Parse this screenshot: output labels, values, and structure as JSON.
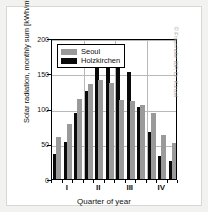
{
  "chart_data": {
    "type": "bar",
    "title": "",
    "xlabel": "Quarter of year",
    "ylabel": "Solar radiation, monthly sum [kWh/m²]",
    "ylim": [
      0,
      200
    ],
    "yticks": [
      0,
      50,
      100,
      150,
      200
    ],
    "xtick_labels": [
      "I",
      "II",
      "III",
      "IV"
    ],
    "grid": true,
    "legend_position": "top-left",
    "categories": [
      "1",
      "2",
      "3",
      "4",
      "5",
      "6",
      "7",
      "8",
      "9",
      "10",
      "11",
      "12"
    ],
    "series": [
      {
        "name": "Seoul",
        "color": "#9a9a9a",
        "values": [
          60,
          78,
          113,
          135,
          141,
          136,
          112,
          110,
          105,
          93,
          62,
          51
        ]
      },
      {
        "name": "Holzkirchen",
        "color": "#0a0a0a",
        "values": [
          36,
          53,
          94,
          125,
          165,
          167,
          173,
          152,
          102,
          66,
          33,
          25
        ]
      }
    ]
  },
  "legend": {
    "items": [
      {
        "label": "Seoul",
        "swatch": "se"
      },
      {
        "label": "Holzkirchen",
        "swatch": "hz"
      }
    ]
  },
  "credit": "© Fraunhofer IBP, Dr. Künzel"
}
